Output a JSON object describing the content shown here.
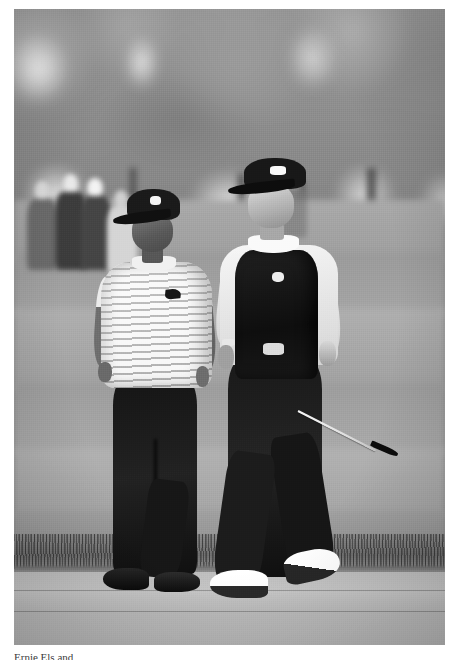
{
  "page": {
    "background_color": "#ffffff",
    "width": 451,
    "height": 660
  },
  "photograph": {
    "name": "golf-photograph",
    "treatment": "black-and-white",
    "scene": "Two professional golfers walking along a cart path on a golf course",
    "frame": {
      "left": 14,
      "top": 9,
      "width": 431,
      "height": 636
    },
    "background": {
      "treeline": "blurred tree canopy across the upper third",
      "gallery": "blurred spectators standing at left behind the fairway",
      "fairway": "horizontal mown stripes of fairway turf",
      "rough": "strip of tall rough grass above the path",
      "path": "light grey concrete cart path in the foreground"
    },
    "subjects": [
      {
        "id": "golfer-left",
        "name": "Tiger Woods",
        "cap": "dark cap with light logo",
        "shirt": "white horizontally striped polo shirt",
        "shirt_logo": "nike-swoosh",
        "trousers": "black trousers",
        "shoes": "dark golf shoes",
        "pose": "walking forward, arms at sides"
      },
      {
        "id": "golfer-right",
        "name": "Ernie Els",
        "cap": "dark cap with light logo",
        "shirt": "white long-sleeve shirt",
        "outer_layer": "dark sleeveless vest with chest logo",
        "trousers": "black trousers",
        "shoes": "white and black golf shoes",
        "accessory": "wristwatch on left wrist",
        "carrying": "golf club (putter) in right hand",
        "pose": "walking forward mid-stride"
      }
    ],
    "tones": {
      "sky_canopy": "#909090",
      "fairway_light": "#b0b0b0",
      "fairway_dark": "#9a9a9a",
      "rough_grass": "#6f6f6f",
      "cart_path": "#bdbdbd",
      "shadow_black": "#141414",
      "shirt_white": "#f3f3f3"
    }
  },
  "caption": {
    "text": "Ernie Els and",
    "note": "caption line cropped at the bottom edge of the page"
  }
}
